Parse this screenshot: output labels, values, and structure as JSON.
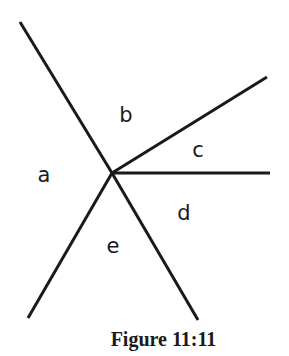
{
  "figure": {
    "caption": "Figure 11:11",
    "center": {
      "x": 112,
      "y": 173
    },
    "rays": [
      {
        "name": "ray-upper-left",
        "x2": 20,
        "y2": 22
      },
      {
        "name": "ray-upper-right",
        "x2": 267,
        "y2": 77
      },
      {
        "name": "ray-right",
        "x2": 270,
        "y2": 173
      },
      {
        "name": "ray-lower-right",
        "x2": 198,
        "y2": 320
      },
      {
        "name": "ray-lower-left",
        "x2": 28,
        "y2": 318
      }
    ],
    "regions": [
      {
        "label": "a",
        "x": 44,
        "y": 175
      },
      {
        "label": "b",
        "x": 126,
        "y": 115
      },
      {
        "label": "c",
        "x": 198,
        "y": 150
      },
      {
        "label": "d",
        "x": 184,
        "y": 213
      },
      {
        "label": "e",
        "x": 113,
        "y": 246
      }
    ],
    "line_color": "#1a1a1a"
  }
}
